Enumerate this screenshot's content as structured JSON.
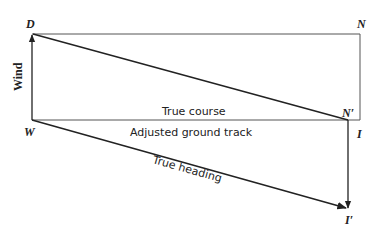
{
  "diagram": {
    "points": {
      "D": "D",
      "N": "N",
      "N_prime": "N′",
      "W": "W",
      "I": "I",
      "I_prime": "I′"
    },
    "labels": {
      "wind": "Wind",
      "true_course": "True course",
      "adjusted_ground_track": "Adjusted ground track",
      "true_heading": "True heading"
    },
    "colors": {
      "line": "#222222",
      "box": "#555555",
      "background": "#ffffff"
    }
  }
}
